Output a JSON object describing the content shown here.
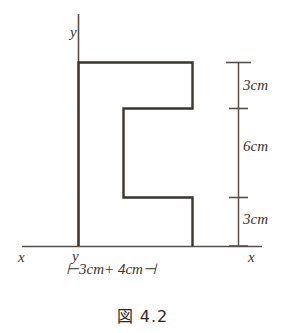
{
  "figure": {
    "caption_symbol": "図",
    "caption_number": "4.2",
    "caption_full": "図 4.2",
    "axis_labels": {
      "x_left": "x",
      "x_right": "x",
      "y_top": "y",
      "y_origin": "y"
    },
    "vertical_dimensions": [
      {
        "label": "3cm",
        "value": 3,
        "unit": "cm",
        "order": 1
      },
      {
        "label": "6cm",
        "value": 6,
        "unit": "cm",
        "order": 2
      },
      {
        "label": "3cm",
        "value": 3,
        "unit": "cm",
        "order": 3
      }
    ],
    "horizontal_dimensions": [
      {
        "label": "3cm",
        "value": 3,
        "unit": "cm",
        "order": 1
      },
      {
        "label": "4cm",
        "value": 4,
        "unit": "cm",
        "order": 2
      }
    ],
    "bottom_dimension_text": "3cm+ 4cm",
    "total_height_cm": 12,
    "total_width_cm": 7,
    "shape": {
      "type": "c-shape-polygon",
      "description": "C shaped cross-section standing on the x axis with left edge on the y axis",
      "outline_color": "#3a352f",
      "axis_color": "#55504a",
      "fill": "none"
    }
  }
}
